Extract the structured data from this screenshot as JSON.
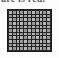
{
  "image": {
    "kind": "grid-thumbnail",
    "background_color": "#fdfdfd"
  },
  "caption": {
    "text": "are is red.",
    "color": "#4a4a4a",
    "note": "bottom sliver of a text line, cropped off at top of thumbnail"
  },
  "figure": {
    "name": "pixel-grid",
    "border_color": "#1b1b1b",
    "gridline_color": "#232323",
    "cell_color": "#9a9a9a",
    "cell_color_light": "#b8b8b8",
    "cell_color_dark": "#7d7d7d",
    "columns": 11,
    "rows": 11,
    "x": 7,
    "y": 9,
    "width": 45,
    "height": 43
  },
  "chart_data": {
    "type": "heatmap",
    "title": "",
    "xlabel": "",
    "ylabel": "",
    "columns": 11,
    "rows": 11,
    "grid": true,
    "legend": "none",
    "colorscale": [
      "#7d7d7d",
      "#9a9a9a",
      "#b8b8b8"
    ],
    "values": [
      [
        2,
        1,
        2,
        1,
        2,
        1,
        2,
        1,
        2,
        1,
        2
      ],
      [
        1,
        2,
        1,
        2,
        1,
        2,
        1,
        2,
        1,
        2,
        1
      ],
      [
        2,
        1,
        2,
        1,
        2,
        1,
        2,
        1,
        2,
        1,
        2
      ],
      [
        1,
        2,
        1,
        2,
        1,
        2,
        1,
        2,
        1,
        2,
        1
      ],
      [
        2,
        1,
        2,
        1,
        2,
        1,
        2,
        1,
        2,
        1,
        2
      ],
      [
        1,
        2,
        1,
        2,
        1,
        2,
        1,
        2,
        1,
        2,
        1
      ],
      [
        2,
        1,
        2,
        1,
        2,
        1,
        2,
        1,
        2,
        1,
        2
      ],
      [
        1,
        2,
        1,
        2,
        1,
        2,
        1,
        2,
        1,
        2,
        1
      ],
      [
        2,
        1,
        2,
        1,
        2,
        1,
        2,
        1,
        2,
        1,
        2
      ],
      [
        1,
        2,
        1,
        2,
        1,
        2,
        1,
        2,
        1,
        2,
        1
      ],
      [
        2,
        1,
        2,
        1,
        2,
        1,
        2,
        1,
        2,
        1,
        2
      ]
    ]
  }
}
